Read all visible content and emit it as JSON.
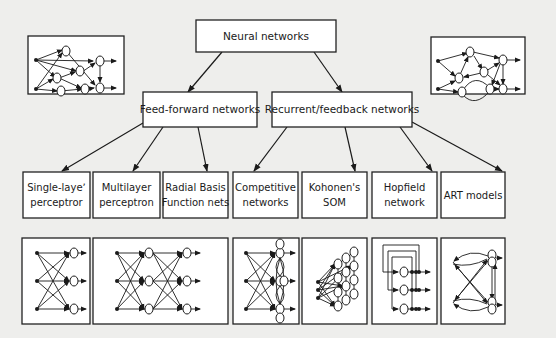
{
  "diagram": {
    "root": {
      "label": "Neural networks"
    },
    "categories": [
      {
        "label": "Feed-forward networks"
      },
      {
        "label": "Recurrent/feedback networks"
      }
    ],
    "leaves": [
      {
        "line1": "Single-layeʼ",
        "line2": "perceptror",
        "parent": "Feed-forward networks"
      },
      {
        "line1": "Multilayer",
        "line2": "perceptron",
        "parent": "Feed-forward networks"
      },
      {
        "line1": "Radial Basis",
        "line2": "Function nets",
        "parent": "Feed-forward networks"
      },
      {
        "line1": "Competitive",
        "line2": "networks",
        "parent": "Recurrent/feedback networks"
      },
      {
        "line1": "Kohonen's",
        "line2": "SOM",
        "parent": "Recurrent/feedback networks"
      },
      {
        "line1": "Hopfield",
        "line2": "network",
        "parent": "Recurrent/feedback networks"
      },
      {
        "line1": "ART models",
        "line2": "",
        "parent": "Recurrent/feedback networks"
      }
    ],
    "illustrations": [
      "feedforward-network-sketch",
      "recurrent-network-sketch",
      "single-layer-perceptron-sketch",
      "multilayer-perceptron-sketch",
      "competitive-network-sketch",
      "kohonen-som-sketch",
      "hopfield-network-sketch",
      "art-model-sketch"
    ]
  }
}
